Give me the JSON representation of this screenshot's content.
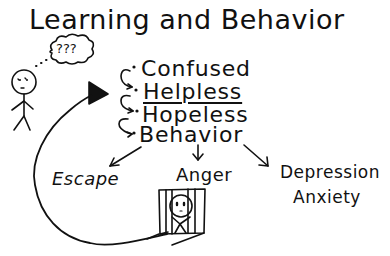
{
  "diagram": {
    "title": "Learning and Behavior",
    "thought_bubble": "???",
    "sequence": [
      {
        "label": "Confused",
        "underlined": false
      },
      {
        "label": "Helpless",
        "underlined": true
      },
      {
        "label": "Hopeless",
        "underlined": false
      },
      {
        "label": "Behavior",
        "underlined": false
      }
    ],
    "outcomes": [
      {
        "label": "Escape"
      },
      {
        "label": "Anger"
      },
      {
        "label": "Depression"
      },
      {
        "label": "Anxiety"
      }
    ],
    "figures": {
      "person": "confused-stick-figure",
      "caged_person": "sad-face-behind-bars"
    },
    "colors": {
      "ink": "#111111",
      "background": "#ffffff"
    }
  }
}
